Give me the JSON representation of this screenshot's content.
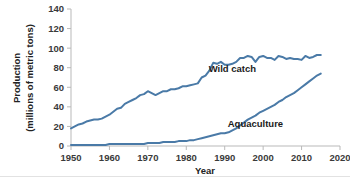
{
  "chart_data": {
    "type": "line",
    "title": "",
    "xlabel": "Year",
    "ylabel": "Production (millions of metric tons)",
    "ylabel_line1": "Production",
    "ylabel_line2": "(millions of metric tons)",
    "xlim": [
      1950,
      2020
    ],
    "ylim": [
      0,
      140
    ],
    "xticks": [
      1950,
      1960,
      1970,
      1980,
      1990,
      2000,
      2010,
      2020
    ],
    "yticks": [
      0,
      20,
      40,
      60,
      80,
      100,
      120,
      140
    ],
    "xtick_labels": [
      "1950",
      "1960",
      "1970",
      "1980",
      "1990",
      "2000",
      "2010",
      "2020"
    ],
    "ytick_labels": [
      "0",
      "20",
      "40",
      "60",
      "80",
      "100",
      "120",
      "140"
    ],
    "grid": false,
    "legend_position": "inline-annotations",
    "line_color": "#4a7aa7",
    "axis_color": "#b9b9b9",
    "x": [
      1950,
      1951,
      1952,
      1953,
      1954,
      1955,
      1956,
      1957,
      1958,
      1959,
      1960,
      1961,
      1962,
      1963,
      1964,
      1965,
      1966,
      1967,
      1968,
      1969,
      1970,
      1971,
      1972,
      1973,
      1974,
      1975,
      1976,
      1977,
      1978,
      1979,
      1980,
      1981,
      1982,
      1983,
      1984,
      1985,
      1986,
      1987,
      1988,
      1989,
      1990,
      1991,
      1992,
      1993,
      1994,
      1995,
      1996,
      1997,
      1998,
      1999,
      2000,
      2001,
      2002,
      2003,
      2004,
      2005,
      2006,
      2007,
      2008,
      2009,
      2010,
      2011,
      2012,
      2013,
      2014,
      2015
    ],
    "series": [
      {
        "name": "Wild catch",
        "color": "#4a7aa7",
        "label_x": 1992,
        "label_y": 76,
        "values": [
          18,
          20,
          22,
          23,
          25,
          26,
          27,
          27,
          28,
          30,
          32,
          35,
          38,
          39,
          43,
          45,
          47,
          49,
          52,
          53,
          56,
          54,
          52,
          54,
          56,
          56,
          58,
          58,
          59,
          61,
          61,
          62,
          63,
          64,
          70,
          72,
          77,
          85,
          84,
          86,
          83,
          83,
          84,
          86,
          90,
          90,
          92,
          91,
          86,
          91,
          92,
          90,
          90,
          88,
          92,
          91,
          89,
          90,
          89,
          89,
          88,
          92,
          90,
          91,
          93,
          93
        ]
      },
      {
        "name": "Aquaculture",
        "color": "#4a7aa7",
        "label_x": 1998,
        "label_y": 19,
        "values": [
          1,
          1,
          1,
          1,
          1,
          1,
          1,
          1,
          1,
          1,
          2,
          2,
          2,
          2,
          2,
          2,
          2,
          2,
          2,
          2,
          3,
          3,
          3,
          3,
          4,
          4,
          4,
          4,
          5,
          5,
          5,
          6,
          6,
          7,
          8,
          9,
          10,
          11,
          12,
          13,
          13,
          14,
          16,
          18,
          21,
          24,
          27,
          29,
          31,
          34,
          36,
          38,
          40,
          42,
          45,
          47,
          50,
          52,
          54,
          57,
          60,
          63,
          66,
          69,
          72,
          74
        ]
      }
    ],
    "annotations": [
      {
        "text": "Wild catch",
        "x": 1992,
        "y": 76
      },
      {
        "text": "Aquaculture",
        "x": 1998,
        "y": 19
      }
    ]
  }
}
